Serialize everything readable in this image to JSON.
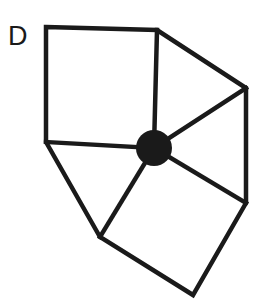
{
  "figure": {
    "label": "D",
    "stroke_color": "#1a1a1a",
    "fill_color": "#1a1a1a",
    "background": "#ffffff",
    "center": {
      "x": 154,
      "y": 148,
      "r": 18
    },
    "outer_vertices": [
      {
        "x": 46,
        "y": 27
      },
      {
        "x": 157,
        "y": 30
      },
      {
        "x": 246,
        "y": 88
      },
      {
        "x": 246,
        "y": 203
      },
      {
        "x": 193,
        "y": 295
      },
      {
        "x": 100,
        "y": 237
      },
      {
        "x": 46,
        "y": 142
      }
    ],
    "faces": [
      "square",
      "triangle",
      "triangle",
      "square",
      "triangle"
    ]
  }
}
